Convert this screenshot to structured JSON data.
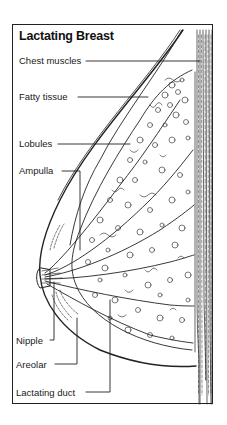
{
  "figure": {
    "title": "Lactating Breast",
    "labels": [
      {
        "id": "chest-muscles",
        "text": "Chest muscles"
      },
      {
        "id": "fatty-tissue",
        "text": "Fatty tissue"
      },
      {
        "id": "lobules",
        "text": "Lobules"
      },
      {
        "id": "ampulla",
        "text": "Ampulla"
      },
      {
        "id": "nipple",
        "text": "Nipple"
      },
      {
        "id": "areolar",
        "text": "Areolar"
      },
      {
        "id": "lactating-duct",
        "text": "Lactating duct"
      }
    ],
    "colors": {
      "line": "#222222",
      "background": "#ffffff"
    }
  }
}
